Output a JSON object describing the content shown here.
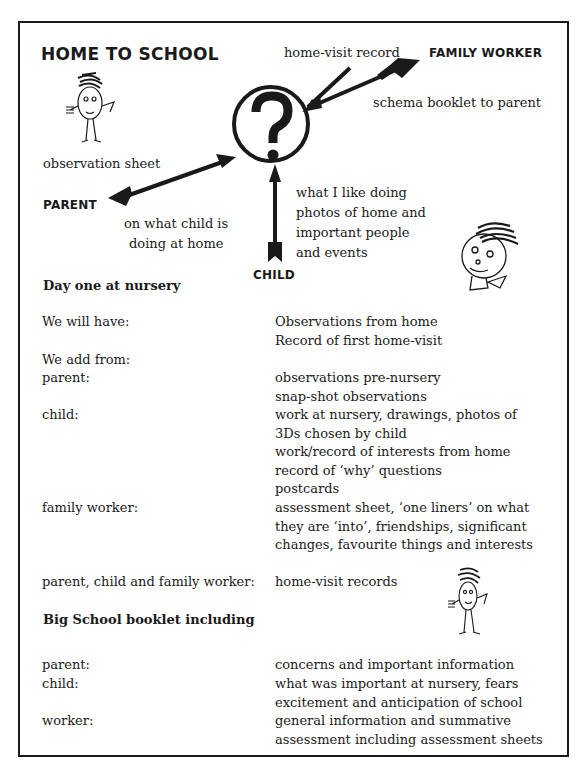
{
  "title": "HOME TO SCHOOL",
  "diagram": {
    "center_symbol": "?",
    "roles": {
      "family_worker": "FAMILY WORKER",
      "parent": "PARENT",
      "child": "CHILD"
    },
    "labels": {
      "home_visit_record": "home-visit record",
      "schema_booklet": "schema booklet to parent",
      "observation_sheet": "observation sheet",
      "parent_line1": "on what child is",
      "parent_line2": "doing at home",
      "child_line1": "what I like doing",
      "child_line2": "photos of home and",
      "child_line3": "important people",
      "child_line4": "and events"
    },
    "icons": [
      "stick-figure-icon",
      "child-face-icon",
      "question-mark-icon",
      "arrow-icon"
    ]
  },
  "section1": {
    "heading": "Day one at nursery",
    "rows": [
      {
        "label": "We will have:",
        "lines": [
          "Observations from home",
          "Record of first home-visit"
        ]
      },
      {
        "label": "We add from:",
        "lines": []
      },
      {
        "label": "parent:",
        "lines": [
          "observations pre-nursery",
          "snap-shot observations"
        ]
      },
      {
        "label": "child:",
        "lines": [
          "work at nursery, drawings, photos of",
          "3Ds chosen by child",
          "work/record of interests from home",
          "record of ‘why’ questions",
          "postcards"
        ]
      },
      {
        "label": "family worker:",
        "lines": [
          "assessment sheet, ‘one liners’ on what",
          "they are ‘into’, friendships, significant",
          "changes, favourite things and interests"
        ]
      },
      {
        "label": "parent, child and family worker:",
        "lines": [
          "home-visit records"
        ]
      }
    ]
  },
  "section2": {
    "heading": "Big School booklet including",
    "rows": [
      {
        "label": "parent:",
        "lines": [
          "concerns and important information"
        ]
      },
      {
        "label": "child:",
        "lines": [
          "what was important at nursery, fears",
          "excitement and anticipation of school"
        ]
      },
      {
        "label": "worker:",
        "lines": [
          "general information and summative",
          "assessment including assessment sheets"
        ]
      }
    ]
  }
}
